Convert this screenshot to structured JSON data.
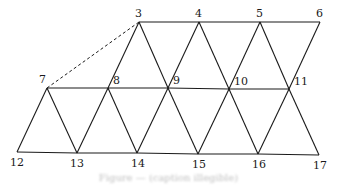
{
  "diagram": {
    "type": "triangular-mesh",
    "vertices": [
      {
        "id": "3",
        "x": 139,
        "y": 22,
        "lx": 135,
        "ly": 17
      },
      {
        "id": "4",
        "x": 199,
        "y": 22,
        "lx": 195,
        "ly": 17
      },
      {
        "id": "5",
        "x": 260,
        "y": 22,
        "lx": 256,
        "ly": 17
      },
      {
        "id": "6",
        "x": 320,
        "y": 22,
        "lx": 316,
        "ly": 17
      },
      {
        "id": "7",
        "x": 47,
        "y": 88,
        "lx": 39,
        "ly": 83
      },
      {
        "id": "8",
        "x": 108,
        "y": 88,
        "lx": 113,
        "ly": 84
      },
      {
        "id": "9",
        "x": 168,
        "y": 88,
        "lx": 173,
        "ly": 84
      },
      {
        "id": "10",
        "x": 229,
        "y": 89,
        "lx": 234,
        "ly": 85
      },
      {
        "id": "11",
        "x": 289,
        "y": 89,
        "lx": 294,
        "ly": 85
      },
      {
        "id": "12",
        "x": 17,
        "y": 152,
        "lx": 10,
        "ly": 166
      },
      {
        "id": "13",
        "x": 77,
        "y": 153,
        "lx": 70,
        "ly": 167
      },
      {
        "id": "14",
        "x": 137,
        "y": 153,
        "lx": 131,
        "ly": 167
      },
      {
        "id": "15",
        "x": 198,
        "y": 154,
        "lx": 192,
        "ly": 168
      },
      {
        "id": "16",
        "x": 258,
        "y": 154,
        "lx": 252,
        "ly": 168
      },
      {
        "id": "17",
        "x": 319,
        "y": 155,
        "lx": 313,
        "ly": 169
      }
    ],
    "edges": [
      [
        "3",
        "4"
      ],
      [
        "4",
        "5"
      ],
      [
        "5",
        "6"
      ],
      [
        "7",
        "8"
      ],
      [
        "8",
        "9"
      ],
      [
        "9",
        "10"
      ],
      [
        "10",
        "11"
      ],
      [
        "12",
        "13"
      ],
      [
        "13",
        "14"
      ],
      [
        "14",
        "15"
      ],
      [
        "15",
        "16"
      ],
      [
        "16",
        "17"
      ],
      [
        "3",
        "8"
      ],
      [
        "3",
        "9"
      ],
      [
        "4",
        "9"
      ],
      [
        "4",
        "10"
      ],
      [
        "5",
        "10"
      ],
      [
        "5",
        "11"
      ],
      [
        "6",
        "11"
      ],
      [
        "7",
        "12"
      ],
      [
        "7",
        "13"
      ],
      [
        "8",
        "13"
      ],
      [
        "8",
        "14"
      ],
      [
        "9",
        "14"
      ],
      [
        "9",
        "15"
      ],
      [
        "10",
        "15"
      ],
      [
        "10",
        "16"
      ],
      [
        "11",
        "16"
      ],
      [
        "11",
        "17"
      ]
    ],
    "dashed_edges": [
      [
        "7",
        "3"
      ]
    ],
    "caption": "Figure — (caption illegible)"
  }
}
